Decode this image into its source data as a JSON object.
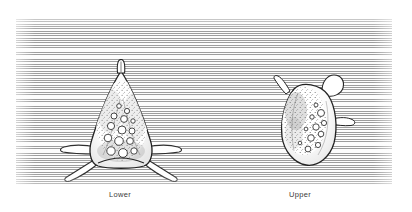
{
  "figure": {
    "kind": "scientific-plate-illustration",
    "medium": "line-engraving",
    "background_hatching": "horizontal-lines",
    "plate_border_color": "#9d9d9d",
    "page_background": "#ffffff",
    "ink_color": "#2a2a2a"
  },
  "captions": {
    "lower": "Lower",
    "upper": "Upper"
  },
  "specimens": [
    {
      "id": "lower",
      "label": "Lower",
      "outline_shape": "triangular",
      "apex_horn": true,
      "lateral_spines": 2,
      "basal_spines": 2,
      "interior_globules": 14,
      "stipple_shading": true
    },
    {
      "id": "upper",
      "label": "Upper",
      "outline_shape": "ovate-irregular",
      "apex_horn": true,
      "lateral_spines": 1,
      "basal_spines": 0,
      "interior_globules": 11,
      "stipple_shading": true
    }
  ]
}
